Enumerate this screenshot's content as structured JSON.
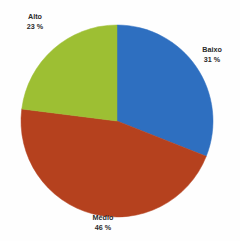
{
  "chart_data": {
    "type": "pie",
    "title": "",
    "title_note": "title row is cropped off the top edge of the screenshot and is illegible",
    "categories": [
      "Baixo",
      "Médio",
      "Alto"
    ],
    "values": [
      31,
      46,
      23
    ],
    "value_unit": "%",
    "labels": [
      {
        "name": "Baixo",
        "value": 31,
        "display_value": "31 %",
        "color": "#2E6FC0"
      },
      {
        "name": "Médio",
        "value": 46,
        "display_value": "46 %",
        "color": "#B5411E"
      },
      {
        "name": "Alto",
        "value": 23,
        "display_value": "23 %",
        "color": "#9DBF33"
      }
    ],
    "start_angle_deg": 0,
    "direction": "clockwise",
    "legend": "none",
    "data_labels_position": "outside",
    "xlabel": "",
    "ylabel": ""
  },
  "geometry": {
    "center_x": 117,
    "center_y": 121,
    "radius": 96
  },
  "colors": {
    "background": "#fefefe",
    "label_text": "#2b2b2b",
    "baixo": "#2E6FC0",
    "medio": "#B5411E",
    "alto": "#9DBF33"
  }
}
